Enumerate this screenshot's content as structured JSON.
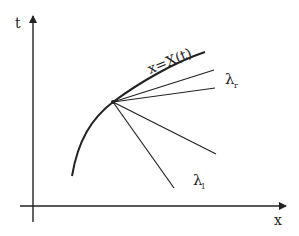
{
  "diagram": {
    "axes": {
      "y_label": "t",
      "x_label": "x"
    },
    "curve_label": "x=X(t)",
    "fan_labels": {
      "upper": {
        "symbol": "λ",
        "subscript": "r"
      },
      "lower": {
        "symbol": "λ",
        "subscript": "l"
      }
    },
    "colors": {
      "stroke": "#222222",
      "background": "#ffffff"
    }
  }
}
